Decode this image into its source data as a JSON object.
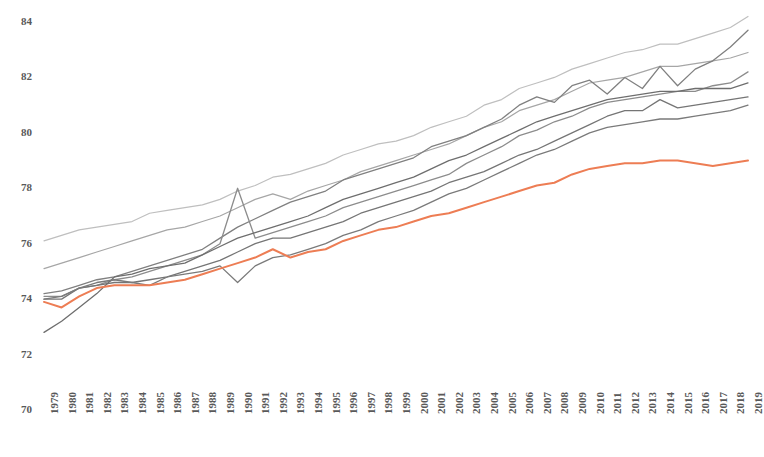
{
  "chart_data": {
    "type": "line",
    "title": "",
    "subtitle": "",
    "xlabel": "",
    "ylabel": "",
    "xlim": [
      1979,
      2019
    ],
    "ylim": [
      70,
      84
    ],
    "grid": false,
    "legend": "none",
    "y_ticks": [
      70,
      72,
      74,
      76,
      78,
      80,
      82,
      84
    ],
    "x_ticks": [
      1979,
      1980,
      1981,
      1982,
      1983,
      1984,
      1985,
      1986,
      1987,
      1988,
      1989,
      1990,
      1991,
      1992,
      1993,
      1994,
      1995,
      1996,
      1997,
      1998,
      1999,
      2000,
      2001,
      2002,
      2003,
      2004,
      2005,
      2006,
      2007,
      2008,
      2009,
      2010,
      2011,
      2012,
      2013,
      2014,
      2015,
      2016,
      2017,
      2018,
      2019
    ],
    "x": [
      1979,
      1980,
      1981,
      1982,
      1983,
      1984,
      1985,
      1986,
      1987,
      1988,
      1989,
      1990,
      1991,
      1992,
      1993,
      1994,
      1995,
      1996,
      1997,
      1998,
      1999,
      2000,
      2001,
      2002,
      2003,
      2004,
      2005,
      2006,
      2007,
      2008,
      2009,
      2010,
      2011,
      2012,
      2013,
      2014,
      2015,
      2016,
      2017,
      2018,
      2019
    ],
    "colors": {
      "highlight": "#ED7D54",
      "gray_light": "#BFBFBF",
      "gray_mid": "#A6A6A6",
      "gray_dark": "#808080",
      "gray_darkest": "#6E6E6E",
      "axis_text": "#595959"
    },
    "series": [
      {
        "name": "series-1-top",
        "color": "#BFBFBF",
        "width": 1.2,
        "highlight": false,
        "values": [
          76.1,
          76.3,
          76.5,
          76.6,
          76.7,
          76.8,
          77.1,
          77.2,
          77.3,
          77.4,
          77.6,
          77.9,
          78.1,
          78.4,
          78.5,
          78.7,
          78.9,
          79.2,
          79.4,
          79.6,
          79.7,
          79.9,
          80.2,
          80.4,
          80.6,
          81.0,
          81.2,
          81.6,
          81.8,
          82.0,
          82.3,
          82.5,
          82.7,
          82.9,
          83.0,
          83.2,
          83.2,
          83.4,
          83.6,
          83.8,
          84.2
        ]
      },
      {
        "name": "series-2",
        "color": "#A6A6A6",
        "width": 1.2,
        "highlight": false,
        "values": [
          75.1,
          75.3,
          75.5,
          75.7,
          75.9,
          76.1,
          76.3,
          76.5,
          76.6,
          76.8,
          77.0,
          77.3,
          77.6,
          77.8,
          77.6,
          77.9,
          78.1,
          78.3,
          78.6,
          78.8,
          79.0,
          79.2,
          79.4,
          79.6,
          79.9,
          80.2,
          80.4,
          80.8,
          81.0,
          81.2,
          81.5,
          81.8,
          81.9,
          82.0,
          82.2,
          82.4,
          82.4,
          82.5,
          82.6,
          82.7,
          82.9
        ]
      },
      {
        "name": "series-3",
        "color": "#808080",
        "width": 1.3,
        "highlight": false,
        "values": [
          74.2,
          74.3,
          74.5,
          74.7,
          74.8,
          75.0,
          75.2,
          75.4,
          75.6,
          75.8,
          76.2,
          76.6,
          76.9,
          77.2,
          77.5,
          77.7,
          77.9,
          78.3,
          78.5,
          78.7,
          78.9,
          79.1,
          79.5,
          79.7,
          79.9,
          80.2,
          80.5,
          81.0,
          81.3,
          81.1,
          81.7,
          81.9,
          81.4,
          82.0,
          81.6,
          82.4,
          81.7,
          82.3,
          82.6,
          83.1,
          83.7
        ]
      },
      {
        "name": "series-4",
        "color": "#8C8C8C",
        "width": 1.3,
        "highlight": false,
        "values": [
          74.1,
          74.1,
          74.4,
          74.5,
          74.7,
          74.8,
          75.0,
          75.2,
          75.4,
          75.6,
          76.0,
          78.0,
          76.2,
          76.4,
          76.6,
          76.8,
          77.0,
          77.3,
          77.5,
          77.7,
          77.9,
          78.1,
          78.3,
          78.5,
          78.9,
          79.2,
          79.5,
          79.9,
          80.1,
          80.4,
          80.6,
          80.9,
          81.1,
          81.2,
          81.3,
          81.4,
          81.5,
          81.5,
          81.7,
          81.8,
          82.2
        ]
      },
      {
        "name": "series-5",
        "color": "#757575",
        "width": 1.3,
        "highlight": false,
        "values": [
          74.0,
          74.0,
          74.4,
          74.5,
          74.6,
          74.6,
          74.7,
          74.8,
          75.0,
          75.2,
          75.4,
          75.7,
          76.0,
          76.2,
          76.2,
          76.4,
          76.6,
          76.8,
          77.1,
          77.3,
          77.5,
          77.7,
          77.9,
          78.2,
          78.4,
          78.6,
          78.9,
          79.2,
          79.4,
          79.7,
          80.0,
          80.3,
          80.6,
          80.8,
          80.8,
          81.2,
          80.9,
          81.0,
          81.1,
          81.2,
          81.3
        ]
      },
      {
        "name": "series-6",
        "color": "#6E6E6E",
        "width": 1.3,
        "highlight": false,
        "values": [
          72.8,
          73.2,
          73.7,
          74.2,
          74.8,
          74.9,
          75.1,
          75.2,
          75.3,
          75.6,
          75.9,
          76.2,
          76.4,
          76.6,
          76.8,
          77.0,
          77.3,
          77.6,
          77.8,
          78.0,
          78.2,
          78.4,
          78.7,
          79.0,
          79.2,
          79.5,
          79.8,
          80.1,
          80.4,
          80.6,
          80.8,
          81.0,
          81.2,
          81.3,
          81.4,
          81.5,
          81.5,
          81.6,
          81.6,
          81.6,
          81.8
        ]
      },
      {
        "name": "series-7",
        "color": "#7A7A7A",
        "width": 1.3,
        "highlight": false,
        "values": [
          74.0,
          74.1,
          74.4,
          74.6,
          74.7,
          74.6,
          74.5,
          74.8,
          74.9,
          75.0,
          75.2,
          74.6,
          75.2,
          75.5,
          75.6,
          75.8,
          76.0,
          76.3,
          76.5,
          76.8,
          77.0,
          77.2,
          77.5,
          77.8,
          78.0,
          78.3,
          78.6,
          78.9,
          79.2,
          79.4,
          79.7,
          80.0,
          80.2,
          80.3,
          80.4,
          80.5,
          80.5,
          80.6,
          80.7,
          80.8,
          81.0
        ]
      },
      {
        "name": "series-highlight",
        "color": "#ED7D54",
        "width": 2.0,
        "highlight": true,
        "values": [
          73.9,
          73.7,
          74.1,
          74.4,
          74.5,
          74.5,
          74.5,
          74.6,
          74.7,
          74.9,
          75.1,
          75.3,
          75.5,
          75.8,
          75.5,
          75.7,
          75.8,
          76.1,
          76.3,
          76.5,
          76.6,
          76.8,
          77.0,
          77.1,
          77.3,
          77.5,
          77.7,
          77.9,
          78.1,
          78.2,
          78.5,
          78.7,
          78.8,
          78.9,
          78.9,
          79.0,
          79.0,
          78.9,
          78.8,
          78.9,
          79.0
        ]
      }
    ]
  },
  "axes": {
    "y_tick_labels": [
      "84",
      "82",
      "80",
      "78",
      "76",
      "74",
      "72",
      "70"
    ],
    "x_tick_labels": [
      "1979",
      "1980",
      "1981",
      "1982",
      "1983",
      "1984",
      "1985",
      "1986",
      "1987",
      "1988",
      "1989",
      "1990",
      "1991",
      "1992",
      "1993",
      "1994",
      "1995",
      "1996",
      "1997",
      "1998",
      "1999",
      "2000",
      "2001",
      "2002",
      "2003",
      "2004",
      "2005",
      "2006",
      "2007",
      "2008",
      "2009",
      "2010",
      "2011",
      "2012",
      "2013",
      "2014",
      "2015",
      "2016",
      "2017",
      "2018",
      "2019"
    ]
  }
}
